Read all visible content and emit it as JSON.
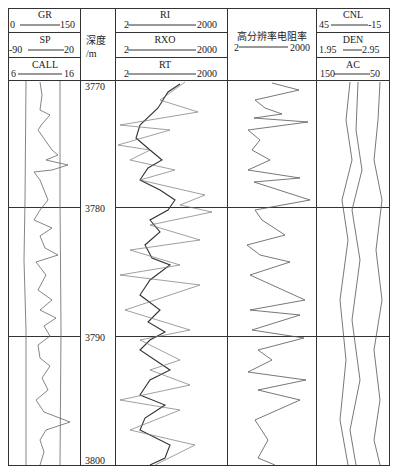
{
  "header": {
    "track1": [
      {
        "name": "GR",
        "min": "0",
        "max": "150"
      },
      {
        "name": "SP",
        "min": "-90",
        "max": "20"
      },
      {
        "name": "CALL",
        "min": "6",
        "max": "16"
      }
    ],
    "depth": {
      "title": "深度",
      "unit": "/m"
    },
    "track2": [
      {
        "name": "RI",
        "min": "2",
        "max": "2000"
      },
      {
        "name": "RXO",
        "min": "2",
        "max": "2000"
      },
      {
        "name": "RT",
        "min": "2",
        "max": "2000"
      }
    ],
    "track3": {
      "name": "高分辨率电阻率",
      "min": "2",
      "max": "2000"
    },
    "track4": [
      {
        "name": "CNL",
        "min": "45",
        "max": "-15"
      },
      {
        "name": "DEN",
        "min": "1.95",
        "max": "2.95"
      },
      {
        "name": "AC",
        "min": "150",
        "max": "50"
      }
    ]
  },
  "depth_ticks": [
    "3770",
    "3780",
    "3790",
    "3800"
  ],
  "colors": {
    "line": "#333333",
    "curve": "#444444",
    "background": "#ffffff"
  }
}
